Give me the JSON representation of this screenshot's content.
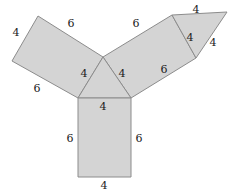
{
  "figure": {
    "type": "geometry-net-diagram",
    "canvas": {
      "width": 228,
      "height": 191
    },
    "style": {
      "fill": "#d4d4d4",
      "stroke": "#8c8c8c",
      "stroke_width": 1,
      "background": "#ffffff",
      "label_color": "#1a1a1a",
      "label_font_size": 11
    },
    "vertices": {
      "center": [
        103,
        57
      ],
      "left_arm_top_outer": [
        38,
        16
      ],
      "left_arm_left_outer": [
        12,
        61
      ],
      "left_arm_base": [
        78,
        98
      ],
      "right_arm_top_outer": [
        172,
        15
      ],
      "right_arm_outer_low": [
        196,
        58
      ],
      "right_arm_base": [
        131,
        98
      ],
      "flap_tip": [
        227,
        12
      ],
      "bottom_rect_bl": [
        78,
        177
      ],
      "bottom_rect_br": [
        131,
        177
      ]
    },
    "shapes": [
      {
        "name": "left-parallelogram",
        "points": "103,57 38,16 12,61 78,98"
      },
      {
        "name": "right-parallelogram",
        "points": "103,57 172,15 196,58 131,98"
      },
      {
        "name": "right-triangle-flap",
        "points": "172,15 227,12 196,58"
      },
      {
        "name": "center-triangle",
        "points": "103,57 78,98 131,98"
      },
      {
        "name": "bottom-rectangle",
        "points": "78,98 131,98 131,177 78,177"
      }
    ],
    "labels": [
      {
        "name": "label-left-arm-outer-short",
        "text": "4",
        "x": 16,
        "y": 32
      },
      {
        "name": "label-left-arm-top-long",
        "text": "6",
        "x": 71,
        "y": 23
      },
      {
        "name": "label-left-arm-bottom-long",
        "text": "6",
        "x": 37,
        "y": 88
      },
      {
        "name": "label-center-triangle-left",
        "text": "4",
        "x": 84,
        "y": 73
      },
      {
        "name": "label-center-triangle-right",
        "text": "4",
        "x": 122,
        "y": 73
      },
      {
        "name": "label-center-triangle-base",
        "text": "4",
        "x": 103,
        "y": 106
      },
      {
        "name": "label-right-arm-top-long",
        "text": "6",
        "x": 136,
        "y": 23
      },
      {
        "name": "label-right-arm-bottom-long",
        "text": "6",
        "x": 164,
        "y": 69
      },
      {
        "name": "label-flap-top",
        "text": "4",
        "x": 196,
        "y": 9
      },
      {
        "name": "label-flap-left",
        "text": "4",
        "x": 190,
        "y": 37
      },
      {
        "name": "label-flap-right",
        "text": "4",
        "x": 213,
        "y": 42
      },
      {
        "name": "label-rect-left",
        "text": "6",
        "x": 70,
        "y": 138
      },
      {
        "name": "label-rect-right",
        "text": "6",
        "x": 139,
        "y": 138
      },
      {
        "name": "label-rect-bottom",
        "text": "4",
        "x": 104,
        "y": 185
      }
    ]
  },
  "chart_data": {
    "type": "diagram",
    "edge_lengths": {
      "short_side": 4,
      "long_side": 6,
      "units": ""
    },
    "annotations": [
      "4",
      "6",
      "6",
      "4",
      "4",
      "4",
      "6",
      "6",
      "4",
      "4",
      "4",
      "6",
      "6",
      "4"
    ]
  }
}
